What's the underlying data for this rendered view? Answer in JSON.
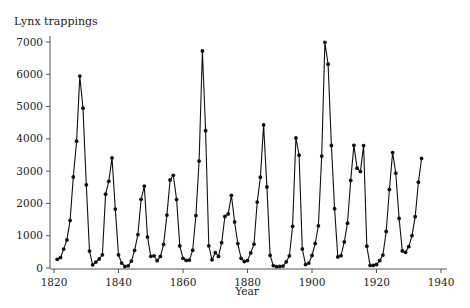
{
  "chart_data": {
    "type": "line",
    "title": "Lynx trappings",
    "xlabel": "Year",
    "ylabel": "Lynx trappings",
    "xlim": [
      1820,
      1940
    ],
    "ylim": [
      0,
      7000
    ],
    "x_ticks": [
      1820,
      1840,
      1860,
      1880,
      1900,
      1920,
      1940
    ],
    "y_ticks": [
      0,
      1000,
      2000,
      3000,
      4000,
      5000,
      6000,
      7000
    ],
    "grid": false,
    "markers": true,
    "x_start": 1821,
    "values": [
      269,
      321,
      585,
      871,
      1475,
      2821,
      3928,
      5943,
      4950,
      2577,
      523,
      98,
      184,
      279,
      409,
      2285,
      2685,
      3409,
      1824,
      409,
      151,
      45,
      68,
      213,
      546,
      1033,
      2129,
      2536,
      957,
      361,
      377,
      225,
      360,
      731,
      1638,
      2725,
      2871,
      2119,
      684,
      299,
      236,
      245,
      552,
      1623,
      3311,
      6721,
      4254,
      687,
      255,
      473,
      358,
      784,
      1594,
      1676,
      2251,
      1426,
      756,
      299,
      201,
      229,
      469,
      736,
      2042,
      2811,
      4431,
      2511,
      389,
      73,
      39,
      49,
      59,
      188,
      377,
      1292,
      4031,
      3495,
      587,
      105,
      153,
      387,
      758,
      1307,
      3465,
      6991,
      6313,
      3794,
      1836,
      345,
      382,
      808,
      1388,
      2713,
      3800,
      3091,
      2985,
      3790,
      674,
      81,
      80,
      108,
      229,
      399,
      1132,
      2432,
      3574,
      2935,
      1537,
      529,
      485,
      662,
      1000,
      1590,
      2657,
      3396
    ]
  }
}
